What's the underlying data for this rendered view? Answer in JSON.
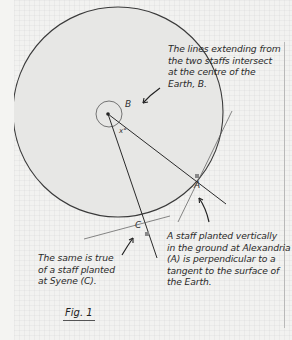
{
  "figure": {
    "caption": "Fig. 1",
    "notes": {
      "centre": [
        "The lines extending from",
        "the two staffs intersect",
        "at the centre of the",
        "Earth, B."
      ],
      "alexandria": [
        "A staff planted vertically",
        "in the ground at Alexandria",
        "(A) is perpendicular to a",
        "tangent to the surface of",
        "the Earth."
      ],
      "syene": [
        "The same is true",
        "of a staff planted",
        "at Syene (C)."
      ]
    },
    "labels": {
      "centre": "B",
      "alexandria": "A",
      "syene": "C",
      "angle": "x°"
    }
  },
  "colors": {
    "paper": "#f2f2f0",
    "ink": "#2a2a2a",
    "earth_fill": "#e6e6e4"
  }
}
